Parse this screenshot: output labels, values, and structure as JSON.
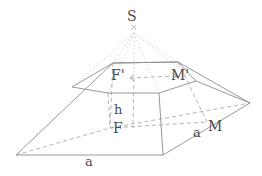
{
  "figure": {
    "kind": "geometry-diagram",
    "stroke_solid": "#8d8d8d",
    "stroke_dashed": "#9a9a9a",
    "stroke_dotted": "#c2c2c2",
    "label_color": "#4a4a4a",
    "background": "#ffffff"
  },
  "labels": [
    {
      "id": "apex",
      "text": "S",
      "x": 127,
      "y": 9,
      "size": 14
    },
    {
      "id": "top-front",
      "text": "F'",
      "x": 111,
      "y": 68,
      "size": 14
    },
    {
      "id": "top-right",
      "text": "M'",
      "x": 171,
      "y": 68,
      "size": 14
    },
    {
      "id": "height",
      "text": "h",
      "x": 114,
      "y": 103,
      "size": 13
    },
    {
      "id": "base-front",
      "text": "F",
      "x": 113,
      "y": 121,
      "size": 14
    },
    {
      "id": "edge-right",
      "text": "a",
      "x": 193,
      "y": 126,
      "size": 13
    },
    {
      "id": "base-right",
      "text": "M",
      "x": 208,
      "y": 119,
      "size": 14
    },
    {
      "id": "edge-bottom",
      "text": "a",
      "x": 85,
      "y": 155,
      "size": 13
    }
  ],
  "geometry": {
    "apex": {
      "x": 134,
      "y": 31
    },
    "top_face": [
      {
        "name": "top-back-left",
        "x": 113,
        "y": 63
      },
      {
        "name": "top-back-right",
        "x": 178,
        "y": 62
      },
      {
        "name": "top-mid-right",
        "x": 196,
        "y": 81
      },
      {
        "name": "top-front-right",
        "x": 159,
        "y": 93
      },
      {
        "name": "top-front-left",
        "x": 108,
        "y": 93
      },
      {
        "name": "top-mid-left",
        "x": 72,
        "y": 87
      }
    ],
    "base_face": [
      {
        "name": "base-back-left",
        "x": 113,
        "y": 63
      },
      {
        "name": "base-back-right",
        "x": 178,
        "y": 62
      },
      {
        "name": "base-mid-right",
        "x": 250,
        "y": 103
      },
      {
        "name": "base-front-right",
        "x": 163,
        "y": 155
      },
      {
        "name": "base-front-left",
        "x": 16,
        "y": 155
      },
      {
        "name": "base-mid-left",
        "x": 16,
        "y": 155
      }
    ]
  }
}
